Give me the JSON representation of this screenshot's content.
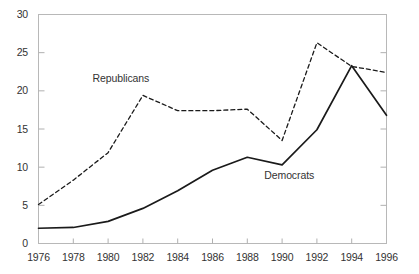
{
  "chart_data": {
    "type": "line",
    "title": "",
    "subtitle": "",
    "xlabel": "",
    "ylabel": "",
    "xlim": [
      1976,
      1996
    ],
    "ylim": [
      0,
      30
    ],
    "grid": false,
    "legend_position": "inline-annotation",
    "x": [
      1976,
      1978,
      1980,
      1982,
      1984,
      1986,
      1988,
      1990,
      1992,
      1994,
      1996
    ],
    "xtick_labels": [
      "1976",
      "1978",
      "1980",
      "1982",
      "1984",
      "1986",
      "1988",
      "1990",
      "1992",
      "1994",
      "1996"
    ],
    "ytick_labels": [
      "0",
      "5",
      "10",
      "15",
      "20",
      "25",
      "30"
    ],
    "yticks": [
      0,
      5,
      10,
      15,
      20,
      25,
      30
    ],
    "series": [
      {
        "name": "Republicans",
        "style": "dashed",
        "color": "#1a1a1a",
        "values": [
          5.1,
          8.3,
          11.9,
          19.4,
          17.4,
          17.4,
          17.6,
          13.5,
          26.3,
          23.2,
          22.4
        ],
        "label_text": "Republicans",
        "label_x": 1981.0,
        "label_y": 21.5
      },
      {
        "name": "Democrats",
        "style": "solid",
        "color": "#1a1a1a",
        "values": [
          2.0,
          2.1,
          2.9,
          4.6,
          6.9,
          9.6,
          11.3,
          10.3,
          14.9,
          23.3,
          16.8
        ],
        "label_text": "Democrats",
        "label_x": 1990.7,
        "label_y": 8.9
      }
    ],
    "axis_color": "#b0b0b0",
    "text_color": "#333333"
  }
}
